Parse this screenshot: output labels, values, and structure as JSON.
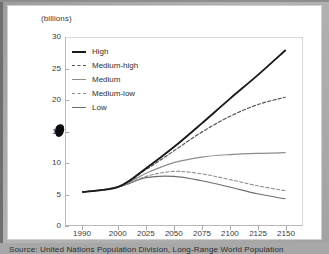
{
  "figure": {
    "unit_label": "(billions)",
    "source_note": "Source: United Nations Population Division, Long-Range World Population"
  },
  "colors": {
    "background": "#a8a8a8",
    "panel": "#ffffff",
    "axis": "#b9b9b9",
    "text": "#3a3a3a",
    "high": "#1a1a1a",
    "medium_high": "#555555",
    "medium": "#8d8d8d",
    "medium_low": "#8d8d8d",
    "low": "#6e6e6e",
    "cursor": "#0b0b0b"
  },
  "chart_data": {
    "type": "line",
    "title": "",
    "subtitle": "",
    "xlabel": "",
    "ylabel": "(billions)",
    "ylim": [
      0,
      30
    ],
    "yticks": [
      0,
      5,
      10,
      15,
      20,
      25,
      30
    ],
    "x": [
      1990,
      2000,
      2025,
      2050,
      2075,
      2100,
      2125,
      2150
    ],
    "xtick_labels": [
      "1990",
      "2000",
      "2025",
      "2050",
      "2075",
      "2100",
      "2125",
      "2150"
    ],
    "x_axis_scale": "non-uniform-category",
    "grid": false,
    "legend_position": "inside-top-left",
    "series": [
      {
        "name": "High",
        "style": "solid",
        "color": "#1a1a1a",
        "width": 1.9,
        "values": [
          5.3,
          6.1,
          9.1,
          12.5,
          16.3,
          20.2,
          24.0,
          28.0
        ]
      },
      {
        "name": "Medium-high",
        "style": "dashed",
        "color": "#555555",
        "width": 1.2,
        "values": [
          5.3,
          6.1,
          8.9,
          11.9,
          14.9,
          17.4,
          19.3,
          20.5
        ]
      },
      {
        "name": "Medium",
        "style": "solid",
        "color": "#8d8d8d",
        "width": 1.2,
        "values": [
          5.3,
          6.1,
          8.3,
          10.0,
          10.9,
          11.3,
          11.5,
          11.6
        ]
      },
      {
        "name": "Medium-low",
        "style": "dashed",
        "color": "#8d8d8d",
        "width": 1.1,
        "values": [
          5.3,
          6.1,
          7.8,
          8.6,
          8.2,
          7.3,
          6.3,
          5.5
        ]
      },
      {
        "name": "Low",
        "style": "solid",
        "color": "#6e6e6e",
        "width": 1.1,
        "values": [
          5.3,
          6.1,
          7.6,
          7.8,
          7.1,
          6.1,
          5.0,
          4.2
        ]
      }
    ]
  },
  "legend": {
    "items": [
      {
        "label": "High"
      },
      {
        "label": "Medium-high"
      },
      {
        "label": "Medium"
      },
      {
        "label": "Medium-low"
      },
      {
        "label": "Low"
      }
    ]
  },
  "cursor": {
    "present": true
  }
}
